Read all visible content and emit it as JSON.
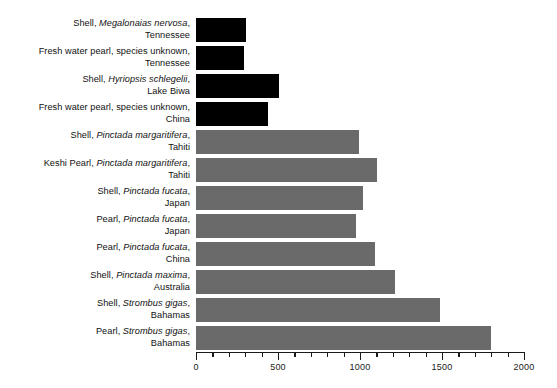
{
  "chart_data": {
    "type": "bar",
    "orientation": "horizontal",
    "title": "",
    "subtitle": "",
    "xlabel": "",
    "ylabel": "",
    "xlim": [
      0,
      2000
    ],
    "grid": false,
    "legend": null,
    "axis": {
      "major_ticks": [
        0,
        500,
        1000,
        1500,
        2000
      ],
      "major_tick_labels": [
        "0",
        "500",
        "1000",
        "1500",
        "2000"
      ],
      "minor_tick_step": 100
    },
    "colors": {
      "freshwater_black": "#000000",
      "saltwater_gray": "#6a6a6a",
      "background": "#ffffff",
      "text": "#111111",
      "axis": "#1a1a1a"
    },
    "categories": [
      "Shell, Megalonaias nervosa, Tennessee",
      "Fresh water pearl, species unknown, Tennessee",
      "Shell, Hyriopsis schlegelii, Lake Biwa",
      "Fresh water pearl, species unknown, China",
      "Shell, Pinctada margaritifera, Tahiti",
      "Keshi Pearl, Pinctada margaritifera, Tahiti",
      "Shell, Pinctada fucata, Japan",
      "Pearl, Pinctada fucata, Japan",
      "Pearl, Pinctada fucata, China",
      "Shell, Pinctada maxima, Australia",
      "Shell, Strombus gigas, Bahamas",
      "Pearl, Strombus gigas, Bahamas"
    ],
    "values": [
      305,
      293,
      505,
      440,
      995,
      1105,
      1020,
      975,
      1090,
      1215,
      1485,
      1800
    ],
    "bars": [
      {
        "line1_pre": "Shell, ",
        "line1_italic": "Megalonaias nervosa",
        "line1_post": ",",
        "line2": "Tennessee",
        "value": 305,
        "color_key": "freshwater_black"
      },
      {
        "line1_pre": "Fresh water pearl, species unknown,",
        "line1_italic": "",
        "line1_post": "",
        "line2": "Tennessee",
        "value": 293,
        "color_key": "freshwater_black"
      },
      {
        "line1_pre": "Shell, ",
        "line1_italic": "Hyriopsis schlegelii",
        "line1_post": ",",
        "line2": "Lake Biwa",
        "value": 505,
        "color_key": "freshwater_black"
      },
      {
        "line1_pre": "Fresh water pearl, species unknown,",
        "line1_italic": "",
        "line1_post": "",
        "line2": "China",
        "value": 440,
        "color_key": "freshwater_black"
      },
      {
        "line1_pre": "Shell, ",
        "line1_italic": "Pinctada margaritifera",
        "line1_post": ",",
        "line2": "Tahiti",
        "value": 995,
        "color_key": "saltwater_gray"
      },
      {
        "line1_pre": "Keshi Pearl, ",
        "line1_italic": "Pinctada margaritifera",
        "line1_post": ",",
        "line2": "Tahiti",
        "value": 1105,
        "color_key": "saltwater_gray"
      },
      {
        "line1_pre": "Shell, ",
        "line1_italic": "Pinctada fucata",
        "line1_post": ",",
        "line2": "Japan",
        "value": 1020,
        "color_key": "saltwater_gray"
      },
      {
        "line1_pre": "Pearl, ",
        "line1_italic": "Pinctada fucata",
        "line1_post": ",",
        "line2": "Japan",
        "value": 975,
        "color_key": "saltwater_gray"
      },
      {
        "line1_pre": "Pearl, ",
        "line1_italic": "Pinctada fucata",
        "line1_post": ",",
        "line2": "China",
        "value": 1090,
        "color_key": "saltwater_gray"
      },
      {
        "line1_pre": "Shell, ",
        "line1_italic": "Pinctada maxima",
        "line1_post": ",",
        "line2": "Australia",
        "value": 1215,
        "color_key": "saltwater_gray"
      },
      {
        "line1_pre": "Shell, ",
        "line1_italic": "Strombus gigas",
        "line1_post": ",",
        "line2": "Bahamas",
        "value": 1485,
        "color_key": "saltwater_gray"
      },
      {
        "line1_pre": "Pearl, ",
        "line1_italic": "Strombus gigas",
        "line1_post": ",",
        "line2": "Bahamas",
        "value": 1800,
        "color_key": "saltwater_gray"
      }
    ]
  }
}
